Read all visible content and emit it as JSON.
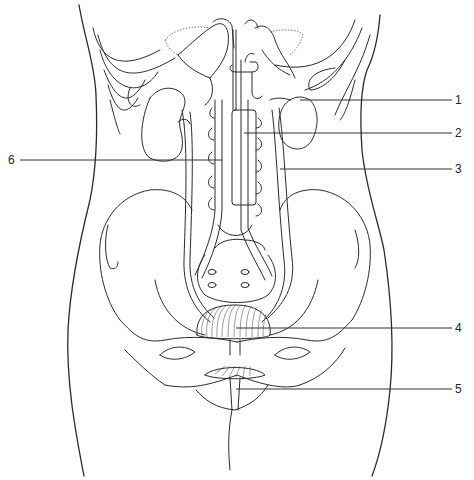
{
  "diagram": {
    "labels": [
      {
        "id": "1",
        "text": "1",
        "side": "right",
        "y": 100
      },
      {
        "id": "2",
        "text": "2",
        "side": "right",
        "y": 133
      },
      {
        "id": "3",
        "text": "3",
        "side": "right",
        "y": 169
      },
      {
        "id": "4",
        "text": "4",
        "side": "right",
        "y": 328
      },
      {
        "id": "5",
        "text": "5",
        "side": "right",
        "y": 389
      },
      {
        "id": "6",
        "text": "6",
        "side": "left",
        "y": 160
      }
    ],
    "colors": {
      "line": "#2a2a2a",
      "background": "#ffffff"
    }
  }
}
